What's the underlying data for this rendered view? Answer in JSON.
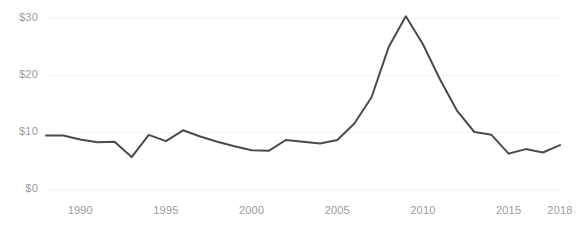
{
  "chart_data": {
    "type": "line",
    "title": "",
    "subtitle": "",
    "xlabel": "",
    "ylabel": "",
    "xlim": [
      1988,
      2018
    ],
    "ylim": [
      0,
      32
    ],
    "grid": true,
    "grid_orientation": "horizontal",
    "legend": "none",
    "line_color": "#4b4b4b",
    "grid_color": "#f5f5f5",
    "axis_text_color": "#9b9b9b",
    "background_color": "#ffffff",
    "y_ticks": [
      {
        "value": 0,
        "label": "$0"
      },
      {
        "value": 10,
        "label": "$10"
      },
      {
        "value": 20,
        "label": "$20"
      },
      {
        "value": 30,
        "label": "$30"
      }
    ],
    "x_ticks": [
      {
        "value": 1990,
        "label": "1990"
      },
      {
        "value": 1995,
        "label": "1995"
      },
      {
        "value": 2000,
        "label": "2000"
      },
      {
        "value": 2005,
        "label": "2005"
      },
      {
        "value": 2010,
        "label": "2010"
      },
      {
        "value": 2015,
        "label": "2015"
      },
      {
        "value": 2018,
        "label": "2018"
      }
    ],
    "x": [
      1988,
      1989,
      1990,
      1991,
      1992,
      1993,
      1994,
      1995,
      1996,
      1997,
      1998,
      1999,
      2000,
      2001,
      2002,
      2003,
      2004,
      2005,
      2006,
      2007,
      2008,
      2009,
      2010,
      2011,
      2012,
      2013,
      2014,
      2015,
      2016,
      2017,
      2018
    ],
    "values": [
      9.4,
      9.4,
      8.7,
      8.2,
      8.3,
      5.6,
      9.5,
      8.4,
      10.3,
      9.2,
      8.3,
      7.5,
      6.8,
      6.7,
      8.6,
      8.3,
      8.0,
      8.6,
      11.5,
      16.1,
      24.9,
      30.3,
      25.4,
      19.2,
      13.7,
      10.0,
      9.5,
      6.2,
      7.0,
      6.4,
      7.7
    ],
    "series": [
      {
        "name": "value",
        "values": [
          9.4,
          9.4,
          8.7,
          8.2,
          8.3,
          5.6,
          9.5,
          8.4,
          10.3,
          9.2,
          8.3,
          7.5,
          6.8,
          6.7,
          8.6,
          8.3,
          8.0,
          8.6,
          11.5,
          16.1,
          24.9,
          30.3,
          25.4,
          19.2,
          13.7,
          10.0,
          9.5,
          6.2,
          7.0,
          6.4,
          7.7
        ]
      }
    ]
  }
}
